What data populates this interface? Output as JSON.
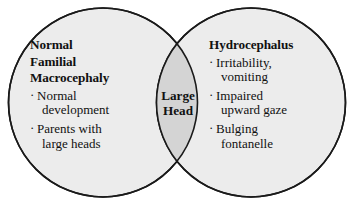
{
  "diagram": {
    "type": "venn",
    "title": "",
    "colors": {
      "circle_fill": "#ececec",
      "overlap_fill": "#d4d4d4",
      "stroke": "#1a1a1a",
      "background": "#ffffff",
      "text": "#111111"
    },
    "left": {
      "heading_lines": [
        "Normal",
        "Familial",
        "Macrocephaly"
      ],
      "heading": "Normal Familial Macrocephaly",
      "bullet_marker": "·",
      "bullets": [
        {
          "line1": "Normal",
          "line2": "development",
          "text": "Normal development"
        },
        {
          "line1": "Parents with",
          "line2": "large heads",
          "text": "Parents with large heads"
        }
      ]
    },
    "center": {
      "lines": [
        "Large",
        "Head"
      ],
      "label": "Large Head"
    },
    "right": {
      "heading_lines": [
        "Hydrocephalus"
      ],
      "heading": "Hydrocephalus",
      "bullet_marker": "·",
      "bullets": [
        {
          "line1": "Irritability,",
          "line2": "vomiting",
          "text": "Irritability, vomiting"
        },
        {
          "line1": "Impaired",
          "line2": "upward gaze",
          "text": "Impaired upward gaze"
        },
        {
          "line1": "Bulging",
          "line2": "fontanelle",
          "text": "Bulging fontanelle"
        }
      ]
    }
  }
}
